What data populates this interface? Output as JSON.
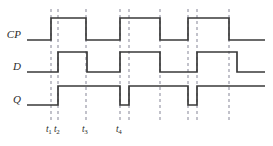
{
  "figure": {
    "width": 273,
    "height": 146,
    "background": "#ffffff",
    "waveform_color": "#3a3a3a",
    "gridline_color": "#9a9aa8",
    "text_color": "#2b2b2b",
    "waveform_stroke_width": 1.7,
    "gridline_stroke_width": 1.2,
    "gridline_dash": "3,3"
  },
  "signals": [
    {
      "name": "CP",
      "label": "CP",
      "label_x": 14,
      "label_y": 34,
      "low_y": 40,
      "high_y": 18,
      "lead_in_x": 27,
      "transitions": [
        {
          "x": 51,
          "edge": "rise"
        },
        {
          "x": 86,
          "edge": "fall"
        },
        {
          "x": 120,
          "edge": "rise"
        },
        {
          "x": 160,
          "edge": "fall"
        },
        {
          "x": 188,
          "edge": "rise"
        },
        {
          "x": 229,
          "edge": "fall"
        }
      ],
      "start_level": "low",
      "end_x": 265
    },
    {
      "name": "D",
      "label": "D",
      "label_x": 17,
      "label_y": 66,
      "low_y": 72,
      "high_y": 52,
      "lead_in_x": 27,
      "transitions": [
        {
          "x": 58,
          "edge": "rise"
        },
        {
          "x": 87,
          "edge": "fall"
        },
        {
          "x": 120,
          "edge": "rise"
        },
        {
          "x": 160,
          "edge": "fall"
        },
        {
          "x": 197,
          "edge": "rise"
        },
        {
          "x": 237,
          "edge": "fall"
        }
      ],
      "start_level": "low",
      "end_x": 265
    },
    {
      "name": "Q",
      "label": "Q",
      "label_x": 17,
      "label_y": 99,
      "low_y": 105,
      "high_y": 86,
      "lead_in_x": 27,
      "transitions": [
        {
          "x": 58,
          "edge": "rise"
        },
        {
          "x": 120,
          "edge": "fall"
        },
        {
          "x": 129,
          "edge": "rise"
        },
        {
          "x": 188,
          "edge": "fall"
        },
        {
          "x": 197,
          "edge": "rise"
        }
      ],
      "start_level": "low",
      "end_x": 265
    }
  ],
  "gridlines": [
    {
      "x": 51,
      "y_top": 9,
      "y_bottom": 121
    },
    {
      "x": 58,
      "y_top": 9,
      "y_bottom": 121
    },
    {
      "x": 86,
      "y_top": 9,
      "y_bottom": 121
    },
    {
      "x": 120,
      "y_top": 9,
      "y_bottom": 121
    },
    {
      "x": 129,
      "y_top": 9,
      "y_bottom": 121
    },
    {
      "x": 160,
      "y_top": 9,
      "y_bottom": 121
    },
    {
      "x": 188,
      "y_top": 9,
      "y_bottom": 121
    },
    {
      "x": 197,
      "y_top": 9,
      "y_bottom": 121
    },
    {
      "x": 229,
      "y_top": 9,
      "y_bottom": 121
    }
  ],
  "time_markers": [
    {
      "id": "t1",
      "base": "t",
      "subscript": "1",
      "x": 46,
      "y": 124
    },
    {
      "id": "t2",
      "base": "t",
      "subscript": "2",
      "x": 54,
      "y": 124
    },
    {
      "id": "t3",
      "base": "t",
      "subscript": "3",
      "x": 82,
      "y": 124
    },
    {
      "id": "t4",
      "base": "t",
      "subscript": "4",
      "x": 116,
      "y": 124
    }
  ]
}
